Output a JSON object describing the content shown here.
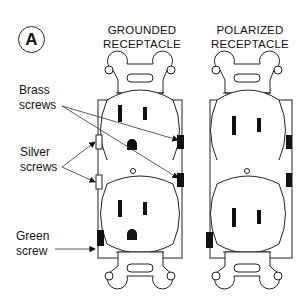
{
  "figure": {
    "badge": "A",
    "titles": {
      "grounded": [
        "GROUNDED",
        "RECEPTACLE"
      ],
      "polarized": [
        "POLARIZED",
        "RECEPTACLE"
      ]
    },
    "labels": {
      "brass": [
        "Brass",
        "screws"
      ],
      "silver": [
        "Silver",
        "screws"
      ],
      "green": [
        "Green",
        "screw"
      ]
    }
  }
}
